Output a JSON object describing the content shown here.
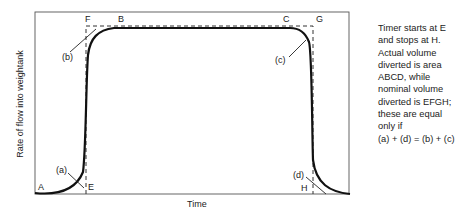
{
  "diagram": {
    "axes": {
      "x_label": "Time",
      "y_label": "Rate of flow into weightank"
    },
    "points": {
      "A": "A",
      "B": "B",
      "C": "C",
      "D": "D",
      "E": "E",
      "F": "F",
      "G": "G",
      "H": "H"
    },
    "regions": {
      "a": "(a)",
      "b": "(b)",
      "c": "(c)",
      "d": "(d)"
    },
    "caption_lines": [
      "Timer starts at E",
      "and stops at H.",
      "Actual volume",
      "diverted is area",
      "ABCD, while",
      "nominal volume",
      "diverted is EFGH;",
      "these are equal",
      "only if",
      "(a) + (d) = (b) + (c)"
    ],
    "colors": {
      "curve": "#111111",
      "dashed": "#333333",
      "frame": "#444444"
    }
  }
}
